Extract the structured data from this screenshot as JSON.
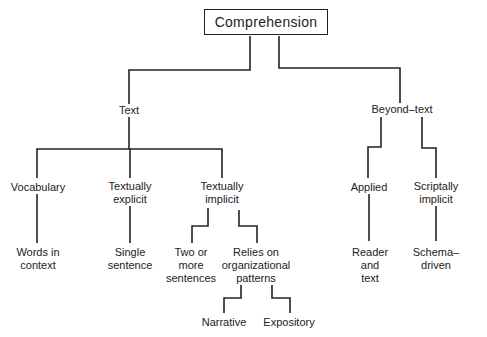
{
  "diagram": {
    "type": "tree",
    "line_color": "#222222",
    "root": {
      "label": "Comprehension"
    },
    "nodes": {
      "text": "Text",
      "beyond_text": "Beyond–text",
      "vocabulary": "Vocabulary",
      "textually_explicit": "Textually\nexplicit",
      "textually_implicit": "Textually\nimplicit",
      "applied": "Applied",
      "scriptally_implicit": "Scriptally\nimplicit",
      "words_in_context": "Words in\ncontext",
      "single_sentence": "Single\nsentence",
      "two_or_more": "Two or\nmore\nsentences",
      "relies_on_patterns": "Relies on\norganizational\npatterns",
      "narrative": "Narrative",
      "expository": "Expository",
      "reader_and_text": "Reader\nand\ntext",
      "schema_driven": "Schema–driven"
    },
    "edges": [
      [
        "Comprehension",
        "Text"
      ],
      [
        "Comprehension",
        "Beyond–text"
      ],
      [
        "Text",
        "Vocabulary"
      ],
      [
        "Text",
        "Textually explicit"
      ],
      [
        "Text",
        "Textually implicit"
      ],
      [
        "Vocabulary",
        "Words in context"
      ],
      [
        "Textually explicit",
        "Single sentence"
      ],
      [
        "Textually implicit",
        "Two or more sentences"
      ],
      [
        "Textually implicit",
        "Relies on organizational patterns"
      ],
      [
        "Relies on organizational patterns",
        "Narrative"
      ],
      [
        "Relies on organizational patterns",
        "Expository"
      ],
      [
        "Beyond–text",
        "Applied"
      ],
      [
        "Beyond–text",
        "Scriptally implicit"
      ],
      [
        "Applied",
        "Reader and text"
      ],
      [
        "Scriptally implicit",
        "Schema–driven"
      ]
    ]
  }
}
